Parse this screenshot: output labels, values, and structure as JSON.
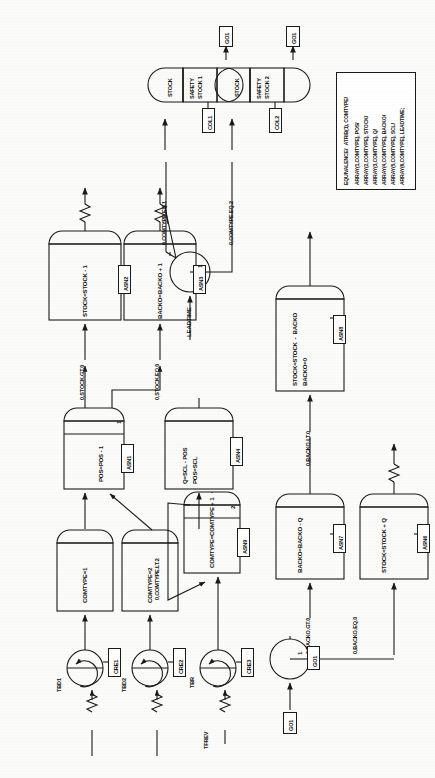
{
  "diagram": {
    "orientation": "rotated-90",
    "line_color": "#1a1a1a",
    "fill_color": "#ffffff",
    "page_background": "#fbfbfa"
  },
  "equivalence_block": {
    "name": "equivalence-declaration",
    "lines": [
      "EQUIVALENCE/   ATRIB(1), COMTYPE/",
      "ARRAY(1,COMTYPE), POS/",
      "ARRAY(2,COMTYPE), STOCK/",
      "ARRAY(3,COMTYPE), Q/",
      "ARRAY(4,COMTYPE), BACKO/",
      "ARRAY(5,COMTYPE), SCL/",
      "ARRAY(6,COMTYPE), LEADTIME;"
    ]
  },
  "create_nodes": [
    {
      "id": "CRE1",
      "tag": "CRE1",
      "interval_label": "TBD1"
    },
    {
      "id": "CRE2",
      "tag": "CRE2",
      "interval_label": "TBD2"
    },
    {
      "id": "CRE3",
      "tag": "CRE3",
      "interval_label": "TBR",
      "offset_label": "TFREV"
    }
  ],
  "assign_nodes": [
    {
      "id": "ASN2",
      "tag": "ASN2",
      "lines": [
        "STOCK=STOCK - 1"
      ],
      "branch_count": ""
    },
    {
      "id": "ASN3",
      "tag": "ASN3",
      "lines": [
        "BACKO=BACKO + 1"
      ],
      "branch_count": ""
    },
    {
      "id": "ASN1",
      "tag": "ASN1",
      "lines": [
        "POS=POS - 1"
      ],
      "branch_count": "1"
    },
    {
      "id": "ASN4",
      "tag": "ASN4",
      "lines": [
        "Q=SCL - POS",
        "POS=SCL"
      ],
      "branch_count": ""
    },
    {
      "id": "ASN9",
      "tag": "ASN9",
      "lines": [
        "COMTYPE=COMTYPE + 1"
      ],
      "branch_count": "2"
    },
    {
      "id": "ASN8",
      "tag": "ASN8",
      "lines": [
        "STOCK=STOCK  -  BACKO",
        "BACKO=0"
      ],
      "branch_count": ""
    },
    {
      "id": "ASN7",
      "tag": "ASN7",
      "lines": [
        "BACKO=BACKO - Q"
      ],
      "branch_count": ""
    },
    {
      "id": "ASN6",
      "tag": "ASN6",
      "lines": [
        "STOCK=STOCK + Q"
      ],
      "branch_count": ""
    },
    {
      "id": "COMTYPE1",
      "tag": "",
      "lines": [
        "COMTYPE=1"
      ],
      "branch_count": ""
    },
    {
      "id": "COMTYPE2",
      "tag": "",
      "lines": [
        "COMTYPE=2"
      ],
      "branch_count": ""
    }
  ],
  "queue_nodes": [
    {
      "id": "Q_STOCK_1",
      "queue_label": "STOCK",
      "activity_label": "SAFETY\nSTOCK 1",
      "tag": "COL1"
    },
    {
      "id": "Q_STOCK_2",
      "queue_label": "STOCK",
      "activity_label": "SAFETY\nSTOCK 2",
      "tag": "COL2"
    }
  ],
  "goon_nodes": [
    {
      "id": "GOON_A",
      "branch_count": "1"
    },
    {
      "id": "GOON_B",
      "branch_count": "1"
    }
  ],
  "terminate_labels": [
    "GO1",
    "GO1"
  ],
  "entry_label": "GO1",
  "goon_tag": "GO1",
  "branch_conditions": [
    "0,STOCK.GT.0",
    "0,STOCK.EQ.0",
    "0,COMTYPE.EQ.1",
    "0,COMTYPE.EQ.2",
    "0,COMTYPE.LT.2",
    "0,BACKO.LT.0",
    "0,BACKO.GT.0",
    "0,BACKO.EQ.0"
  ],
  "activity_durations": [
    "LEADTIME"
  ]
}
